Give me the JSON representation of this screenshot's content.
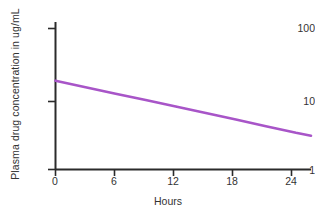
{
  "figure": {
    "background_color": "#ffffff",
    "axis_color": "#2b2b2b",
    "text_color": "#333333",
    "series_color": "#a855c8"
  },
  "axes": {
    "y_title": "Plasma drug concentration in ug/mL",
    "x_title": "Hours",
    "y_ticks": [
      {
        "label": "1",
        "value": 1
      },
      {
        "label": "10",
        "value": 10
      },
      {
        "label": "100",
        "value": 100
      }
    ],
    "x_ticks": [
      {
        "label": "0",
        "value": 0
      },
      {
        "label": "6",
        "value": 6
      },
      {
        "label": "12",
        "value": 12
      },
      {
        "label": "18",
        "value": 18
      },
      {
        "label": "24",
        "value": 24
      }
    ]
  },
  "caption_crop": "",
  "chart_data": {
    "type": "line",
    "title": "",
    "subtitle": "",
    "xlabel": "Hours",
    "ylabel": "Plasma drug concentration in ug/mL",
    "yscale": "log",
    "xscale": "linear",
    "xlim": [
      0,
      25.5
    ],
    "ylim": [
      1,
      100
    ],
    "grid": false,
    "legend": "none",
    "xticks": [
      0,
      6,
      12,
      18,
      24
    ],
    "yticks": [
      1,
      10,
      100
    ],
    "series": [
      {
        "name": "Plasma drug concentration",
        "color": "#a855c8",
        "x": [
          0,
          3,
          6,
          9,
          12,
          15,
          18,
          21,
          24,
          25.5
        ],
        "values": [
          18.0,
          14.6,
          11.8,
          9.6,
          7.8,
          6.3,
          5.1,
          4.1,
          3.3,
          3.0
        ]
      }
    ],
    "annotations": []
  }
}
